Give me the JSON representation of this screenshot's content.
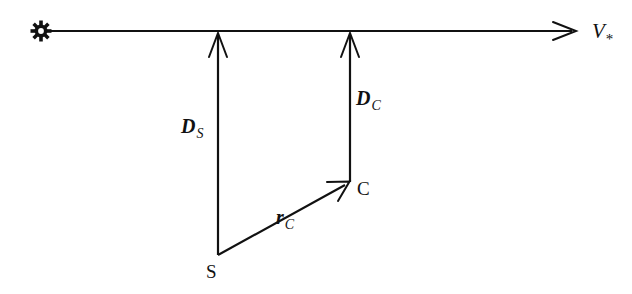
{
  "figure": {
    "background_color": "#ffffff",
    "ink_color": "#111111",
    "width": 632,
    "height": 294
  },
  "observer": {
    "icon_name": "sun-star-icon",
    "label": "",
    "x": 41,
    "y": 31
  },
  "axis": {
    "name": "optical-axis",
    "label": "V",
    "subscript": "*",
    "from_x": 41,
    "to_x": 577,
    "y": 31,
    "label_x": 592,
    "label_y": 38
  },
  "points": [
    {
      "id": "S",
      "label": "S",
      "x": 218,
      "y": 255,
      "label_x": 206,
      "label_y": 278
    },
    {
      "id": "C",
      "label": "C",
      "x": 350,
      "y": 182,
      "label_x": 357,
      "label_y": 195
    }
  ],
  "vectors": [
    {
      "id": "D_S",
      "name": "distance-source-vector",
      "label": "D",
      "subscript": "S",
      "from_x": 218,
      "from_y": 255,
      "to_x": 218,
      "to_y": 32,
      "label_x": 181,
      "label_y": 133
    },
    {
      "id": "D_C",
      "name": "distance-lens-vector",
      "label": "D",
      "subscript": "C",
      "from_x": 350,
      "from_y": 182,
      "to_x": 350,
      "to_y": 32,
      "label_x": 356,
      "label_y": 105
    },
    {
      "id": "r_C",
      "name": "impact-parameter-vector",
      "label": "r",
      "subscript": "C",
      "from_x": 218,
      "from_y": 255,
      "to_x": 350,
      "to_y": 182,
      "label_x": 276,
      "label_y": 224
    }
  ]
}
